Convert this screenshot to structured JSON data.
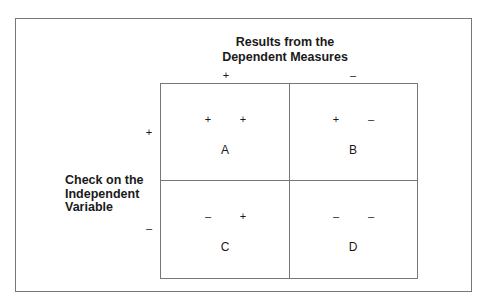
{
  "title": {
    "line1": "Results from the",
    "line2": "Dependent Measures"
  },
  "column_signs": [
    "+",
    "–"
  ],
  "row_signs": [
    "+",
    "–"
  ],
  "row_label": {
    "line1": "Check on the",
    "line2": "Independent",
    "line3": "Variable"
  },
  "cells": [
    {
      "label": "A",
      "signs": [
        "+",
        "+"
      ]
    },
    {
      "label": "B",
      "signs": [
        "+",
        "–"
      ]
    },
    {
      "label": "C",
      "signs": [
        "–",
        "+"
      ]
    },
    {
      "label": "D",
      "signs": [
        "–",
        "–"
      ]
    }
  ]
}
